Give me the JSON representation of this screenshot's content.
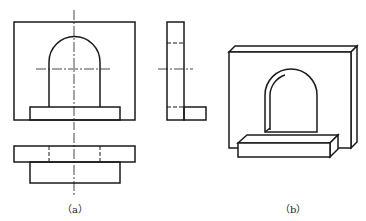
{
  "figure": {
    "views": [
      {
        "id": "front-view",
        "description": "Front view of arch bracket"
      },
      {
        "id": "side-view",
        "description": "Left side view"
      },
      {
        "id": "top-view",
        "description": "Top view"
      },
      {
        "id": "isometric-view",
        "description": "Pictorial (isometric) view"
      }
    ],
    "labels": {
      "a": "（a）",
      "b": "（b）"
    },
    "colors": {
      "line": "#1a1a1a",
      "background": "#ffffff"
    }
  }
}
